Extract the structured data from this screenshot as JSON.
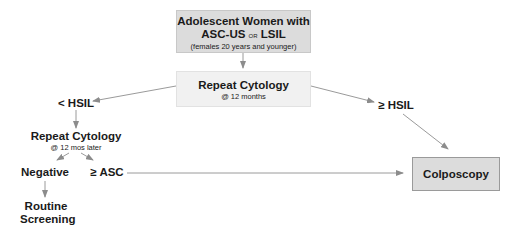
{
  "diagram": {
    "type": "flowchart",
    "nodes": {
      "start": {
        "line1": "Adolescent Women with",
        "line2_a": "ASC-US",
        "line2_or": "or",
        "line2_b": "LSIL",
        "line3": "(females 20 years and younger)"
      },
      "repeat1": {
        "title": "Repeat Cytology",
        "subtitle": "@ 12 months"
      },
      "lt_hsil": {
        "label": "< HSIL"
      },
      "ge_hsil": {
        "label": "≥ HSIL"
      },
      "repeat2": {
        "title": "Repeat Cytology",
        "subtitle": "@ 12  mos later"
      },
      "negative": {
        "label": "Negative"
      },
      "ge_asc": {
        "label": "≥ ASC"
      },
      "routine": {
        "line1": "Routine",
        "line2": "Screening"
      },
      "colposcopy": {
        "label": "Colposcopy"
      }
    },
    "edges": [
      [
        "start",
        "repeat1"
      ],
      [
        "repeat1",
        "lt_hsil"
      ],
      [
        "repeat1",
        "ge_hsil"
      ],
      [
        "lt_hsil",
        "repeat2"
      ],
      [
        "repeat2",
        "negative"
      ],
      [
        "repeat2",
        "ge_asc"
      ],
      [
        "negative",
        "routine"
      ],
      [
        "ge_asc",
        "colposcopy"
      ],
      [
        "ge_hsil",
        "colposcopy"
      ]
    ],
    "colors": {
      "box_dark": "#dcdcdc",
      "box_light": "#f1f1f1",
      "arrow": "#8c8c8c",
      "text": "#1a1a1a"
    }
  }
}
